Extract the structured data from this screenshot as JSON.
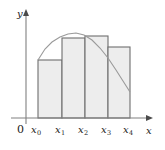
{
  "figure": {
    "kind": "riemann-sum-diagram",
    "background_color": "#ffffff"
  },
  "axes": {
    "y_axis_label": "y",
    "x_axis_label": "x",
    "origin_label": "0",
    "axis_color": "#808080",
    "axis_x_y_px": 118,
    "axis_y_x_px": 26,
    "x_axis_end_px": 152,
    "y_axis_top_px": 11
  },
  "ticks": {
    "labels": [
      "x0",
      "x1",
      "x2",
      "x3",
      "x4"
    ],
    "label_parts": [
      {
        "base": "x",
        "sub": "0"
      },
      {
        "base": "x",
        "sub": "1"
      },
      {
        "base": "x",
        "sub": "2"
      },
      {
        "base": "x",
        "sub": "3"
      },
      {
        "base": "x",
        "sub": "4"
      }
    ],
    "x_positions_px": [
      38,
      62,
      85,
      108,
      130
    ]
  },
  "chart_data": {
    "type": "bar",
    "title": "",
    "xlabel": "x",
    "ylabel": "y",
    "grid": false,
    "legend": null,
    "categories": [
      "x0-x1",
      "x1-x2",
      "x2-x3",
      "x3-x4"
    ],
    "partition_x": [
      38,
      62,
      85,
      108,
      130
    ],
    "bar_top_y_px": [
      60,
      38,
      36,
      47
    ],
    "bar_heights_px": [
      58,
      80,
      82,
      71
    ],
    "bar_fill_color": "#ededed",
    "bar_stroke_color": "#6e6e6e",
    "curve": {
      "type": "line",
      "stroke_color": "#9a9a9a",
      "points": [
        [
          38,
          60
        ],
        [
          45,
          49
        ],
        [
          52,
          42
        ],
        [
          60,
          37
        ],
        [
          68,
          34
        ],
        [
          76,
          33
        ],
        [
          84,
          35
        ],
        [
          92,
          40
        ],
        [
          100,
          48
        ],
        [
          108,
          58
        ],
        [
          116,
          70
        ],
        [
          123,
          81
        ],
        [
          130,
          92
        ]
      ]
    }
  }
}
